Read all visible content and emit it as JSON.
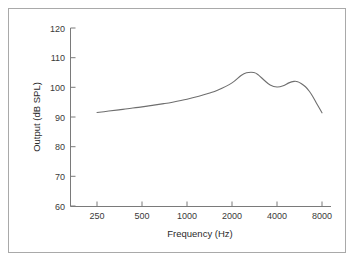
{
  "chart_data": {
    "type": "line",
    "title": "",
    "xlabel": "Frequency (Hz)",
    "ylabel": "Output (dB SPL)",
    "xscale": "log",
    "xlim": [
      250,
      8000
    ],
    "ylim": [
      60,
      120
    ],
    "xticks": [
      250,
      500,
      1000,
      2000,
      4000,
      8000
    ],
    "xticklabels": [
      "250",
      "500",
      "1000",
      "2000",
      "4000",
      "8000"
    ],
    "yticks": [
      60,
      70,
      80,
      90,
      100,
      110,
      120
    ],
    "yticklabels": [
      "60",
      "70",
      "80",
      "90",
      "100",
      "110",
      "120"
    ],
    "grid": false,
    "legend": null,
    "series": [
      {
        "name": "Output",
        "x": [
          250,
          300,
          350,
          400,
          500,
          600,
          700,
          800,
          1000,
          1200,
          1400,
          1600,
          2000,
          2300,
          2500,
          2800,
          3000,
          3300,
          3600,
          4000,
          4400,
          4800,
          5200,
          5500,
          5800,
          6200,
          6600,
          7000,
          7400,
          8000
        ],
        "values": [
          91.5,
          92.0,
          92.4,
          92.8,
          93.4,
          94.0,
          94.5,
          95.0,
          96.0,
          97.0,
          98.0,
          99.0,
          101.5,
          104.0,
          104.9,
          105.0,
          104.2,
          102.3,
          100.8,
          100.1,
          100.5,
          101.5,
          102.0,
          101.9,
          101.3,
          100.2,
          98.6,
          96.6,
          94.4,
          91.4
        ]
      }
    ],
    "annotations": []
  },
  "axes": {
    "ylabel_text": "Output (dB SPL)",
    "xlabel_text": "Frequency (Hz)"
  },
  "colors": {
    "curve": "#6e6e6e",
    "axis": "#7a7a7a",
    "frame": "#a9a9a9",
    "background": "#ffffff",
    "text": "#3a3a3a"
  }
}
